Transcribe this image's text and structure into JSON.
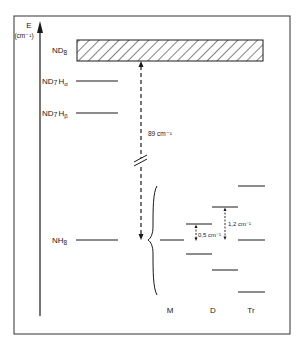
{
  "axis": {
    "label": "E",
    "unit": "(cm⁻¹)"
  },
  "levels": {
    "nd8": {
      "label_main": "ND",
      "label_sub": "8"
    },
    "nd7ha": {
      "label_main": "ND",
      "label_sub1": "7",
      "label_mid": "H",
      "label_sub2": "α"
    },
    "nd7hb": {
      "label_main": "ND",
      "label_sub1": "7",
      "label_mid": "H",
      "label_sub2": "β"
    },
    "nh8": {
      "label_main": "NH",
      "label_sub": "8"
    }
  },
  "gap": {
    "label": "89 cm⁻¹"
  },
  "splittings": {
    "d_gap": "0,5 cm⁻¹",
    "tr_gap": "1,2 cm⁻¹"
  },
  "columns": {
    "m": "M",
    "d": "D",
    "tr": "Tr"
  }
}
